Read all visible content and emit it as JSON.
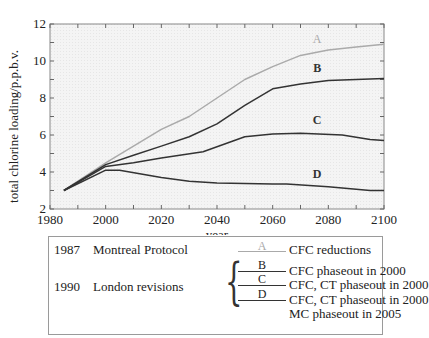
{
  "chart_data": {
    "type": "line",
    "title": "",
    "xlabel": "year",
    "ylabel": "total chlorine loading/p.p.b.v.",
    "xlim": [
      1980,
      2100
    ],
    "ylim": [
      2,
      12
    ],
    "xticks": [
      1980,
      2000,
      2020,
      2040,
      2060,
      2080,
      2100
    ],
    "yticks": [
      2,
      4,
      6,
      8,
      10,
      12
    ],
    "grid": false,
    "series": [
      {
        "name": "A",
        "color": "#aaaaaa",
        "x": [
          1985,
          2000,
          2010,
          2020,
          2030,
          2040,
          2050,
          2060,
          2070,
          2080,
          2090,
          2100
        ],
        "values": [
          3.0,
          4.5,
          5.4,
          6.3,
          7.0,
          8.0,
          9.0,
          9.7,
          10.3,
          10.6,
          10.75,
          10.9
        ]
      },
      {
        "name": "B",
        "color": "#333333",
        "x": [
          1985,
          2000,
          2010,
          2020,
          2030,
          2040,
          2050,
          2060,
          2070,
          2080,
          2090,
          2100
        ],
        "values": [
          3.0,
          4.4,
          4.9,
          5.4,
          5.9,
          6.6,
          7.6,
          8.5,
          8.75,
          8.95,
          9.0,
          9.05
        ]
      },
      {
        "name": "C",
        "color": "#333333",
        "x": [
          1985,
          2000,
          2010,
          2020,
          2035,
          2050,
          2060,
          2070,
          2085,
          2095,
          2100
        ],
        "values": [
          3.0,
          4.3,
          4.5,
          4.75,
          5.1,
          5.9,
          6.05,
          6.1,
          6.0,
          5.75,
          5.7
        ]
      },
      {
        "name": "D",
        "color": "#333333",
        "x": [
          1985,
          2000,
          2005,
          2020,
          2030,
          2040,
          2060,
          2065,
          2080,
          2095,
          2100
        ],
        "values": [
          3.0,
          4.1,
          4.1,
          3.7,
          3.5,
          3.4,
          3.35,
          3.35,
          3.2,
          3.0,
          3.0
        ]
      }
    ],
    "annotations": [
      {
        "text": "A",
        "x": 2076,
        "y": 11.0
      },
      {
        "text": "B",
        "x": 2076,
        "y": 9.4
      },
      {
        "text": "C",
        "x": 2076,
        "y": 6.6
      },
      {
        "text": "D",
        "x": 2076,
        "y": 3.7
      }
    ],
    "legend_position": "below"
  },
  "legend": {
    "montreal": {
      "year": "1987",
      "name": "Montreal Protocol",
      "sample": "A",
      "desc": "CFC reductions"
    },
    "london": {
      "year": "1990",
      "name": "London revisions",
      "items": [
        {
          "sample": "B",
          "desc": "CFC phaseout in 2000"
        },
        {
          "sample": "C",
          "desc": "CFC, CT phaseout in 2000"
        },
        {
          "sample": "D",
          "desc": "CFC, CT phaseout in 2000",
          "desc2": "MC phaseout in 2005"
        }
      ]
    }
  }
}
